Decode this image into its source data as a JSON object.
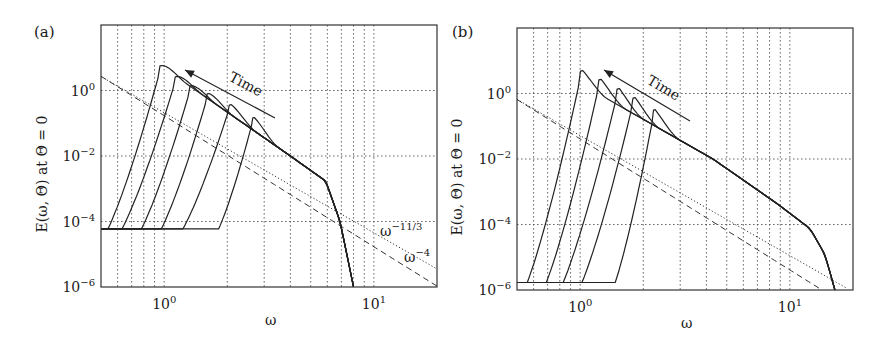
{
  "figure": {
    "panels": [
      "(a)",
      "(b)"
    ]
  },
  "chart_data": [
    {
      "panel": "(a)",
      "type": "line",
      "xscale": "log",
      "yscale": "log",
      "xlabel": "ω",
      "ylabel": "E(ω, Θ) at Θ = 0",
      "xlim": [
        0.5,
        20
      ],
      "ylim": [
        1e-06,
        100
      ],
      "xticks": [
        {
          "value": 1,
          "label": "10",
          "exp": "0"
        },
        {
          "value": 10,
          "label": "10",
          "exp": "1"
        }
      ],
      "yticks": [
        {
          "value": 1,
          "label": "10",
          "exp": "0"
        },
        {
          "value": 0.01,
          "label": "10",
          "exp": "−2"
        },
        {
          "value": 0.0001,
          "label": "10",
          "exp": "−4"
        },
        {
          "value": 1e-06,
          "label": "10",
          "exp": "−6"
        }
      ],
      "grid": {
        "x": [
          0.6,
          0.7,
          0.8,
          0.9,
          1,
          2,
          3,
          4,
          5,
          6,
          7,
          8,
          9,
          10
        ],
        "y": [
          1,
          0.01,
          0.0001
        ]
      },
      "floor": 6e-05,
      "series": [
        {
          "name": "t1",
          "liftoff": 0.54,
          "peak": [
            0.98,
            5.8
          ]
        },
        {
          "name": "t2",
          "liftoff": 0.63,
          "peak": [
            1.16,
            2.7
          ]
        },
        {
          "name": "t3",
          "liftoff": 0.78,
          "peak": [
            1.36,
            1.4
          ]
        },
        {
          "name": "t4",
          "liftoff": 0.97,
          "peak": [
            1.64,
            0.81
          ]
        },
        {
          "name": "t5",
          "liftoff": 1.23,
          "peak": [
            2.09,
            0.37
          ]
        },
        {
          "name": "t6",
          "liftoff": 1.82,
          "peak": [
            2.69,
            0.15
          ]
        }
      ],
      "envelope": [
        [
          3.0,
          0.036
        ],
        [
          4.0,
          0.01
        ],
        [
          5.9,
          0.0017
        ],
        [
          6.9,
          0.0001
        ],
        [
          8.0,
          1e-06
        ]
      ],
      "reference_lines": [
        {
          "name": "ω^-11/3",
          "style": "dotted",
          "coef": 0.21,
          "exponent": -3.6667,
          "label": "ω",
          "label_exp": "−11/3"
        },
        {
          "name": "ω^-4",
          "style": "dashed",
          "coef": 0.17,
          "exponent": -4,
          "label": "ω",
          "label_exp": "−4"
        }
      ],
      "annotation": {
        "text": "Time",
        "arrow_direction": "toward lower ω / higher peak"
      }
    },
    {
      "panel": "(b)",
      "type": "line",
      "xscale": "log",
      "yscale": "log",
      "xlabel": "ω",
      "ylabel": "E(ω, Θ) at Θ = 0",
      "xlim": [
        0.5,
        20
      ],
      "ylim": [
        1e-06,
        100
      ],
      "xticks": [
        {
          "value": 1,
          "label": "10",
          "exp": "0"
        },
        {
          "value": 10,
          "label": "10",
          "exp": "1"
        }
      ],
      "yticks": [
        {
          "value": 1,
          "label": "10",
          "exp": "0"
        },
        {
          "value": 0.01,
          "label": "10",
          "exp": "−2"
        },
        {
          "value": 0.0001,
          "label": "10",
          "exp": "−4"
        },
        {
          "value": 1e-06,
          "label": "10",
          "exp": "−6"
        }
      ],
      "grid": {
        "x": [
          0.6,
          0.7,
          0.8,
          0.9,
          1,
          2,
          3,
          4,
          5,
          6,
          7,
          8,
          9,
          10
        ],
        "y": [
          1,
          0.01,
          0.0001
        ]
      },
      "floor": 1.7e-06,
      "series": [
        {
          "name": "t1",
          "liftoff": 0.56,
          "peak": [
            1.03,
            5.0
          ]
        },
        {
          "name": "t2",
          "liftoff": 0.69,
          "peak": [
            1.26,
            2.7
          ]
        },
        {
          "name": "t3",
          "liftoff": 0.83,
          "peak": [
            1.54,
            1.4
          ]
        },
        {
          "name": "t4",
          "liftoff": 1.02,
          "peak": [
            1.83,
            0.75
          ]
        },
        {
          "name": "t5",
          "liftoff": 1.47,
          "peak": [
            2.28,
            0.32
          ]
        }
      ],
      "envelope": [
        [
          2.96,
          0.039
        ],
        [
          4.3,
          0.01
        ],
        [
          8.8,
          0.00041
        ],
        [
          12.5,
          7.4e-05
        ],
        [
          14.7,
          1.2e-05
        ],
        [
          16.4,
          1e-06
        ]
      ],
      "reference_lines": [
        {
          "name": "ω^-11/3",
          "style": "dotted",
          "coef": 0.052,
          "exponent": -3.6667
        },
        {
          "name": "ω^-4",
          "style": "dashed",
          "coef": 0.041,
          "exponent": -4
        }
      ],
      "annotation": {
        "text": "Time",
        "arrow_direction": "toward lower ω / higher peak"
      }
    }
  ]
}
